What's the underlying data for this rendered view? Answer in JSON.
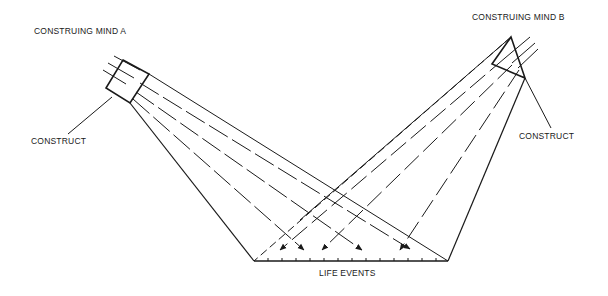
{
  "labels": {
    "mind_a": "CONSTRUING MIND A",
    "mind_b": "CONSTRUING MIND B",
    "construct_a": "CONSTRUCT",
    "construct_b": "CONSTRUCT",
    "life_events": "LIFE EVENTS"
  },
  "colors": {
    "stroke": "#1a1a1a",
    "background": "#ffffff"
  }
}
